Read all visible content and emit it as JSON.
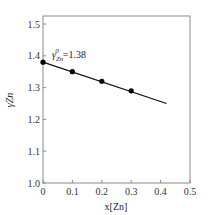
{
  "chart_data": {
    "type": "line",
    "title": "",
    "xlabel": "x[Zn]",
    "ylabel": "γZn",
    "xlim": [
      0,
      0.5
    ],
    "ylim": [
      1.0,
      1.5
    ],
    "x_ticks": [
      "0",
      "0.1",
      "0.2",
      "0.3",
      "0.4",
      "0.5"
    ],
    "y_ticks": [
      "1.0",
      "1.1",
      "1.2",
      "1.3",
      "1.4",
      "1.5"
    ],
    "grid": false,
    "series": [
      {
        "name": "measured",
        "marker": "circle",
        "x": [
          0,
          0.1,
          0.2,
          0.3
        ],
        "y": [
          1.38,
          1.35,
          1.32,
          1.29
        ]
      },
      {
        "name": "fit",
        "style": "line",
        "x": [
          0,
          0.42
        ],
        "y": [
          1.38,
          1.25
        ]
      }
    ],
    "annotations": [
      {
        "text_main": "γ",
        "text_sub": "Zn",
        "text_sup": "0",
        "text_value": "=1.38",
        "x": 0.03,
        "y": 1.39
      }
    ]
  },
  "colors": {
    "axis": "#888888",
    "line": "#111111",
    "marker": "#000000"
  }
}
